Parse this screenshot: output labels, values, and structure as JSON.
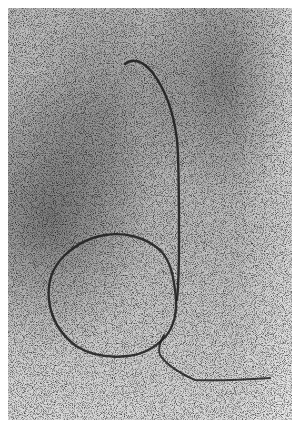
{
  "image": {
    "description": "Black-and-white photograph of a line drawn in speckled sand forming a letter 'd' shape",
    "tone": "grayscale",
    "colors": {
      "border": "#ffffff",
      "background_light": "#d9d9d9",
      "background_dark": "#8f8f8f",
      "line": "#1e1e1e"
    }
  }
}
